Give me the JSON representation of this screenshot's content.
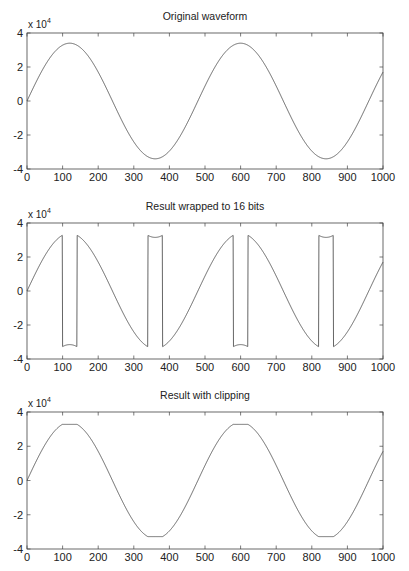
{
  "figure": {
    "width": 409,
    "height": 571,
    "line_color": "#555555",
    "axis_color": "#444444"
  },
  "chart_data": [
    {
      "type": "line",
      "title": "Original waveform",
      "xlabel": "",
      "ylabel": "",
      "y_exponent_label": "x 10",
      "y_exponent": "4",
      "xlim": [
        0,
        1000
      ],
      "ylim": [
        -40000,
        40000
      ],
      "xticks": [
        0,
        100,
        200,
        300,
        400,
        500,
        600,
        700,
        800,
        900,
        1000
      ],
      "yticks": [
        -4,
        -2,
        0,
        2,
        4
      ],
      "grid": false,
      "series": [
        {
          "name": "original",
          "formula": "34000*sin(2*pi*n/480)",
          "amplitude": 34000,
          "period": 480,
          "n_points": 1001
        }
      ],
      "mode": "none"
    },
    {
      "type": "line",
      "title": "Result wrapped to 16 bits",
      "xlabel": "",
      "ylabel": "",
      "y_exponent_label": "x 10",
      "y_exponent": "4",
      "xlim": [
        0,
        1000
      ],
      "ylim": [
        -40000,
        40000
      ],
      "xticks": [
        0,
        100,
        200,
        300,
        400,
        500,
        600,
        700,
        800,
        900,
        1000
      ],
      "yticks": [
        -4,
        -2,
        0,
        2,
        4
      ],
      "grid": false,
      "series": [
        {
          "name": "wrapped",
          "formula": "int16 wrap of 34000*sin(2*pi*n/480)",
          "amplitude": 34000,
          "period": 480,
          "n_points": 1001
        }
      ],
      "mode": "wrap"
    },
    {
      "type": "line",
      "title": "Result with clipping",
      "xlabel": "",
      "ylabel": "",
      "y_exponent_label": "x 10",
      "y_exponent": "4",
      "xlim": [
        0,
        1000
      ],
      "ylim": [
        -40000,
        40000
      ],
      "xticks": [
        0,
        100,
        200,
        300,
        400,
        500,
        600,
        700,
        800,
        900,
        1000
      ],
      "yticks": [
        -4,
        -2,
        0,
        2,
        4
      ],
      "grid": false,
      "series": [
        {
          "name": "clipped",
          "formula": "clip(34000*sin(2*pi*n/480), -32768, 32767)",
          "amplitude": 34000,
          "period": 480,
          "n_points": 1001
        }
      ],
      "mode": "clip"
    }
  ],
  "layout": {
    "plots": [
      {
        "left": 27,
        "top": 33,
        "right": 383,
        "bottom": 169
      },
      {
        "left": 27,
        "top": 223,
        "right": 383,
        "bottom": 359
      },
      {
        "left": 27,
        "top": 412,
        "right": 383,
        "bottom": 549
      }
    ]
  }
}
